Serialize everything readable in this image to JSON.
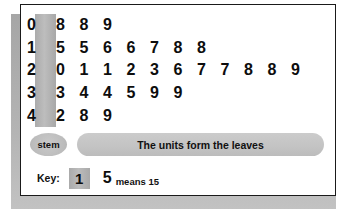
{
  "chart_data": {
    "type": "table",
    "stem_header": "stem",
    "leaves_note": "The units form the leaves",
    "rows": [
      {
        "stem": "0",
        "leaves": [
          "8",
          "8",
          "9"
        ],
        "values": [
          8,
          8,
          9
        ]
      },
      {
        "stem": "1",
        "leaves": [
          "5",
          "5",
          "6",
          "6",
          "7",
          "8",
          "8"
        ],
        "values": [
          15,
          15,
          16,
          16,
          17,
          18,
          18
        ]
      },
      {
        "stem": "2",
        "leaves": [
          "0",
          "1",
          "1",
          "2",
          "3",
          "6",
          "7",
          "7",
          "8",
          "8",
          "9"
        ],
        "values": [
          20,
          21,
          21,
          22,
          23,
          26,
          27,
          27,
          28,
          28,
          29
        ]
      },
      {
        "stem": "3",
        "leaves": [
          "3",
          "4",
          "4",
          "5",
          "9",
          "9"
        ],
        "values": [
          33,
          34,
          34,
          35,
          39,
          39
        ]
      },
      {
        "stem": "4",
        "leaves": [
          "2",
          "8",
          "9"
        ],
        "values": [
          42,
          48,
          49
        ]
      }
    ],
    "key": {
      "label": "Key:",
      "stem": "1",
      "leaf": "5",
      "means_text": "means 15",
      "means_value": 15
    },
    "colors": {
      "stem_band": "#b3b3b3",
      "banner": "#c6c6c6",
      "pill": "#c0c0c0",
      "card_border": "#1a1a1a",
      "shadow": "#a9a9a9",
      "text": "#0d0d0d"
    }
  },
  "plot": {
    "stem_pill_label": "stem",
    "banner_text": "The units form the leaves",
    "row0": {
      "stem": "0",
      "l0": "8",
      "l1": "8",
      "l2": "9"
    },
    "row1": {
      "stem": "1",
      "l0": "5",
      "l1": "5",
      "l2": "6",
      "l3": "6",
      "l4": "7",
      "l5": "8",
      "l6": "8"
    },
    "row2": {
      "stem": "2",
      "l0": "0",
      "l1": "1",
      "l2": "1",
      "l3": "2",
      "l4": "3",
      "l5": "6",
      "l6": "7",
      "l7": "7",
      "l8": "8",
      "l9": "8",
      "l10": "9"
    },
    "row3": {
      "stem": "3",
      "l0": "3",
      "l1": "4",
      "l2": "4",
      "l3": "5",
      "l4": "9",
      "l5": "9"
    },
    "row4": {
      "stem": "4",
      "l0": "2",
      "l1": "8",
      "l2": "9"
    },
    "key": {
      "label": "Key:",
      "stem": "1",
      "leaf": "5",
      "means": "means 15"
    }
  }
}
